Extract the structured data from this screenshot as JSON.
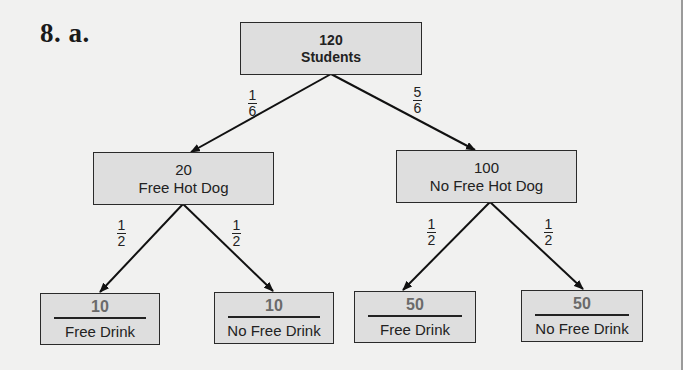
{
  "problem_label": "8. a.",
  "tree": {
    "root": {
      "count": "120",
      "label": "Students"
    },
    "level1": [
      {
        "count": "20",
        "label": "Free Hot Dog",
        "probability": {
          "num": "1",
          "den": "6"
        }
      },
      {
        "count": "100",
        "label": "No Free Hot Dog",
        "probability": {
          "num": "5",
          "den": "6"
        }
      }
    ],
    "level2": [
      {
        "count": "10",
        "label": "Free Drink",
        "probability": {
          "num": "1",
          "den": "2"
        }
      },
      {
        "count": "10",
        "label": "No Free Drink",
        "probability": {
          "num": "1",
          "den": "2"
        }
      },
      {
        "count": "50",
        "label": "Free Drink",
        "probability": {
          "num": "1",
          "den": "2"
        }
      },
      {
        "count": "50",
        "label": "No Free Drink",
        "probability": {
          "num": "1",
          "den": "2"
        }
      }
    ]
  },
  "colors": {
    "background": "#f1f1f0",
    "box_fill": "#dedede",
    "box_border": "#2a2a2a",
    "leaf_count": "#6a6a6a"
  }
}
